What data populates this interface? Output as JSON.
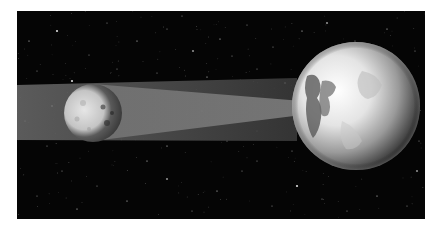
{
  "figure": {
    "colors": {
      "page_background": "#ffffff",
      "space": "#050505",
      "penumbra": "#5a5a5a",
      "umbra_cone": "#777777",
      "moon_lit": "#d8d8d8",
      "moon_dark": "#3a3a3a",
      "earth_lit": "#f2f2f2",
      "earth_dark": "#1a1a1a"
    },
    "objects": [
      {
        "name": "moon",
        "cx": 93,
        "cy": 113,
        "r": 29
      },
      {
        "name": "earth",
        "cx": 356,
        "cy": 106,
        "r": 64
      }
    ],
    "stars": [
      [
        40,
        20
      ],
      [
        72,
        44
      ],
      [
        90,
        12
      ],
      [
        120,
        30
      ],
      [
        150,
        18
      ],
      [
        176,
        40
      ],
      [
        203,
        28
      ],
      [
        230,
        14
      ],
      [
        256,
        36
      ],
      [
        285,
        20
      ],
      [
        310,
        12
      ],
      [
        338,
        30
      ],
      [
        370,
        18
      ],
      [
        398,
        40
      ],
      [
        20,
        60
      ],
      [
        55,
        70
      ],
      [
        100,
        58
      ],
      [
        140,
        62
      ],
      [
        190,
        66
      ],
      [
        240,
        58
      ],
      [
        268,
        72
      ],
      [
        300,
        50
      ],
      [
        45,
        160
      ],
      [
        80,
        175
      ],
      [
        110,
        190
      ],
      [
        150,
        168
      ],
      [
        175,
        200
      ],
      [
        200,
        180
      ],
      [
        225,
        160
      ],
      [
        255,
        195
      ],
      [
        280,
        175
      ],
      [
        305,
        188
      ],
      [
        330,
        200
      ],
      [
        360,
        185
      ],
      [
        390,
        195
      ],
      [
        400,
        160
      ],
      [
        130,
        150
      ],
      [
        240,
        150
      ],
      [
        20,
        185
      ],
      [
        60,
        198
      ],
      [
        395,
        90
      ],
      [
        402,
        130
      ],
      [
        12,
        30
      ],
      [
        165,
        5
      ],
      [
        215,
        45
      ],
      [
        335,
        60
      ],
      [
        275,
        140
      ],
      [
        210,
        130
      ],
      [
        185,
        100
      ],
      [
        160,
        80
      ],
      [
        35,
        95
      ],
      [
        8,
        110
      ],
      [
        240,
        120
      ],
      [
        30,
        135
      ],
      [
        150,
        135
      ]
    ]
  }
}
